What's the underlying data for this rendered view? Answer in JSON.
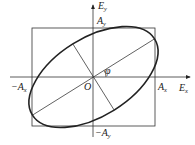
{
  "diagram": {
    "axes": {
      "x_label": "E",
      "x_label_sub": "x",
      "y_label": "E",
      "y_label_sub": "y"
    },
    "labels": {
      "origin": "O",
      "angle": "φ",
      "pos_ax": "A",
      "pos_ax_sub": "x",
      "neg_ax": "−A",
      "neg_ax_sub": "x",
      "pos_ay": "A",
      "pos_ay_sub": "y",
      "neg_ay": "−A",
      "neg_ay_sub": "y"
    },
    "colors": {
      "stroke": "#222222",
      "background": "#ffffff"
    }
  }
}
